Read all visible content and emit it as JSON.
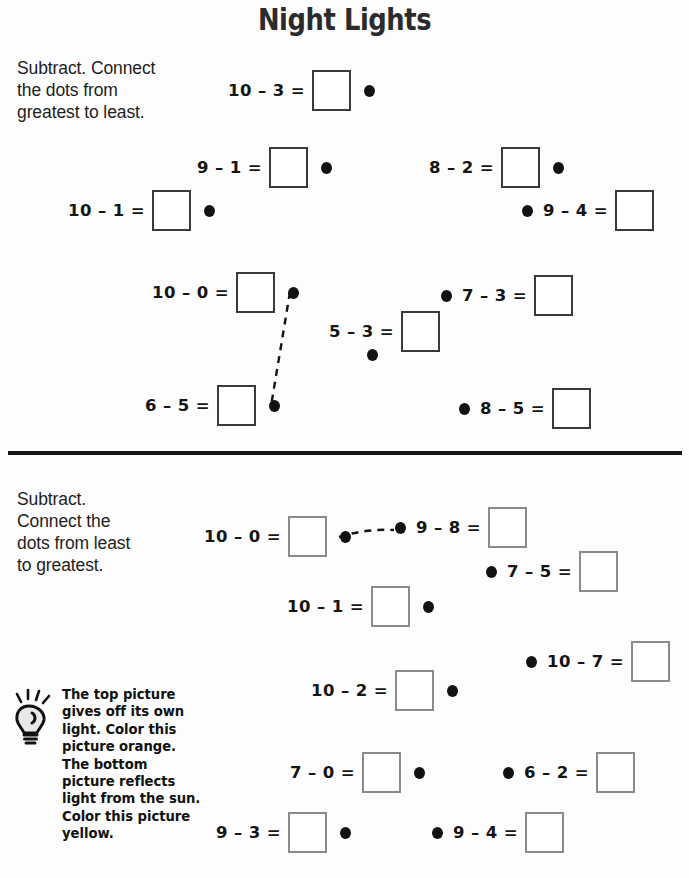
{
  "title": "Night Lights",
  "sections": [
    {
      "id": "top",
      "instructions": "Subtract. Connect\nthe dots from\ngreatest to least.",
      "box_border_color": "#3a3a3a",
      "problems": [
        {
          "expr": "10 – 3 =",
          "dot_side": "right",
          "x": 228,
          "y": 70
        },
        {
          "expr": "9 – 1 =",
          "dot_side": "right",
          "x": 197,
          "y": 147
        },
        {
          "expr": "8 – 2 =",
          "dot_side": "right",
          "x": 429,
          "y": 147
        },
        {
          "expr": "10 – 1 =",
          "dot_side": "right",
          "x": 68,
          "y": 190
        },
        {
          "expr": "9 – 4 =",
          "dot_side": "left",
          "x": 522,
          "y": 190
        },
        {
          "expr": "10 – 0 =",
          "dot_side": "right",
          "x": 152,
          "y": 272
        },
        {
          "expr": "7 – 3 =",
          "dot_side": "left",
          "x": 441,
          "y": 275
        },
        {
          "expr": "5 – 3 =",
          "dot_side": "below",
          "x": 329,
          "y": 311
        },
        {
          "expr": "6 – 5 =",
          "dot_side": "right",
          "x": 145,
          "y": 385
        },
        {
          "expr": "8 – 5 =",
          "dot_side": "left",
          "x": 459,
          "y": 388
        }
      ],
      "connectors": [
        {
          "from": "10 – 0 =",
          "to": "6 – 5 =",
          "x1": 290,
          "y1": 292,
          "x2": 271,
          "y2": 406
        }
      ]
    },
    {
      "id": "bottom",
      "instructions": "Subtract.\nConnect the\ndots from least\nto greatest.",
      "box_border_color": "#8a8a8a",
      "problems": [
        {
          "expr": "10 – 0 =",
          "dot_side": "right",
          "x": 204,
          "y": 516
        },
        {
          "expr": "9 – 8 =",
          "dot_side": "left",
          "x": 395,
          "y": 507
        },
        {
          "expr": "7 – 5 =",
          "dot_side": "left",
          "x": 486,
          "y": 551
        },
        {
          "expr": "10 – 1 =",
          "dot_side": "right",
          "x": 287,
          "y": 586
        },
        {
          "expr": "10 – 7 =",
          "dot_side": "left",
          "x": 526,
          "y": 641
        },
        {
          "expr": "10 – 2 =",
          "dot_side": "right",
          "x": 311,
          "y": 670
        },
        {
          "expr": "7 – 0 =",
          "dot_side": "right",
          "x": 290,
          "y": 752
        },
        {
          "expr": "6 – 2 =",
          "dot_side": "left",
          "x": 503,
          "y": 752
        },
        {
          "expr": "9 – 3 =",
          "dot_side": "right",
          "x": 216,
          "y": 812
        },
        {
          "expr": "9 – 4 =",
          "dot_side": "left",
          "x": 432,
          "y": 812
        }
      ],
      "connectors": [
        {
          "from": "10 – 0 =",
          "to": "9 – 8 =",
          "x1": 339,
          "y1": 537,
          "x2": 394,
          "y2": 530
        }
      ]
    }
  ],
  "note": {
    "icon": "lightbulb-icon",
    "text": "The top picture gives off its own light. Color this picture orange. The bottom picture reflects light from the sun. Color this picture yellow."
  }
}
